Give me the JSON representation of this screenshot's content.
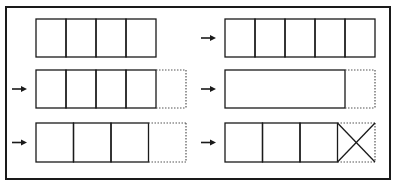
{
  "diagram": {
    "title": "",
    "colors": {
      "stroke": "#1a1a1a",
      "dotted": "#555555",
      "background": "#ffffff"
    },
    "frame": {
      "x": 6,
      "y": 7,
      "width": 384,
      "height": 172
    },
    "panels": [
      {
        "id": "left-row-1",
        "arrow": false,
        "x": 36,
        "y": 19,
        "height": 38,
        "solid_cells": [
          30,
          30,
          30,
          30
        ],
        "dotted_extension": 0,
        "crossed_last": false
      },
      {
        "id": "left-row-2",
        "arrow": true,
        "x": 36,
        "y": 70,
        "height": 38,
        "solid_cells": [
          30,
          30,
          30,
          30
        ],
        "dotted_extension": 30,
        "crossed_last": false
      },
      {
        "id": "left-row-3",
        "arrow": true,
        "x": 36,
        "y": 123,
        "height": 39,
        "solid_cells": [
          37.5,
          37.5,
          37.5
        ],
        "dotted_extension": 37.5,
        "crossed_last": false
      },
      {
        "id": "right-row-1",
        "arrow": true,
        "x": 225,
        "y": 19,
        "height": 38,
        "solid_cells": [
          30,
          30,
          30,
          30,
          30
        ],
        "dotted_extension": 0,
        "crossed_last": false
      },
      {
        "id": "right-row-2",
        "arrow": true,
        "x": 225,
        "y": 70,
        "height": 38,
        "solid_cells": [
          120
        ],
        "dotted_extension": 30,
        "crossed_last": false
      },
      {
        "id": "right-row-3",
        "arrow": true,
        "x": 225,
        "y": 123,
        "height": 39,
        "solid_cells": [
          37.5,
          37.5,
          37.5
        ],
        "dotted_extension": 37.5,
        "crossed_last": true
      }
    ]
  }
}
